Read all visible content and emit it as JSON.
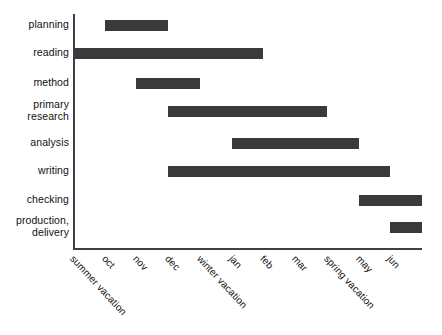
{
  "chart_data": {
    "type": "bar",
    "subtype": "gantt",
    "title": "",
    "xlabel": "",
    "ylabel": "",
    "orientation": "horizontal",
    "grid": false,
    "legend": false,
    "axis_color": "#3f3f3f",
    "bar_color": "#3a3a3a",
    "background": "#ffffff",
    "x_tick_labels": [
      "summer vacation",
      "oct",
      "nov",
      "dec",
      "winter vacation",
      "jan",
      "feb",
      "mar",
      "spring vacation",
      "may",
      "jun"
    ],
    "x_tick_index": [
      0,
      1,
      2,
      3,
      4,
      5,
      6,
      7,
      8,
      9,
      10
    ],
    "xlim": [
      0,
      11
    ],
    "categories": [
      "planning",
      "reading",
      "method",
      "primary research",
      "analysis",
      "writing",
      "checking",
      "production, delivery"
    ],
    "tasks": [
      {
        "label": "planning",
        "label_lines": [
          "planning"
        ],
        "start_tick": 1.0,
        "end_tick": 3.0,
        "start_label": "oct",
        "end_label": "dec"
      },
      {
        "label": "reading",
        "label_lines": [
          "reading"
        ],
        "start_tick": 0.0,
        "end_tick": 6.0,
        "start_label": "summer vacation",
        "end_label": "feb"
      },
      {
        "label": "method",
        "label_lines": [
          "method"
        ],
        "start_tick": 2.0,
        "end_tick": 4.0,
        "start_label": "nov",
        "end_label": "winter vacation"
      },
      {
        "label": "primary research",
        "label_lines": [
          "primary",
          "research"
        ],
        "start_tick": 3.0,
        "end_tick": 8.0,
        "start_label": "dec",
        "end_label": "spring vacation"
      },
      {
        "label": "analysis",
        "label_lines": [
          "analysis"
        ],
        "start_tick": 5.0,
        "end_tick": 9.0,
        "start_label": "jan",
        "end_label": "may"
      },
      {
        "label": "writing",
        "label_lines": [
          "writing"
        ],
        "start_tick": 3.0,
        "end_tick": 10.0,
        "start_label": "dec",
        "end_label": "jun"
      },
      {
        "label": "checking",
        "label_lines": [
          "checking"
        ],
        "start_tick": 9.0,
        "end_tick": 11.0,
        "start_label": "may",
        "end_label": "end"
      },
      {
        "label": "production, delivery",
        "label_lines": [
          "production,",
          "delivery"
        ],
        "start_tick": 10.0,
        "end_tick": 11.0,
        "start_label": "jun",
        "end_label": "end"
      }
    ]
  },
  "geometry": {
    "axis_left_px": 73,
    "axis_right_px": 422,
    "axis_top_px": 14,
    "axis_baseline_px": 249,
    "tick_step_px": 31.73,
    "row_centers_px": [
      25,
      53,
      83,
      111,
      143,
      171,
      200,
      227
    ],
    "bar_height_px": 11
  }
}
